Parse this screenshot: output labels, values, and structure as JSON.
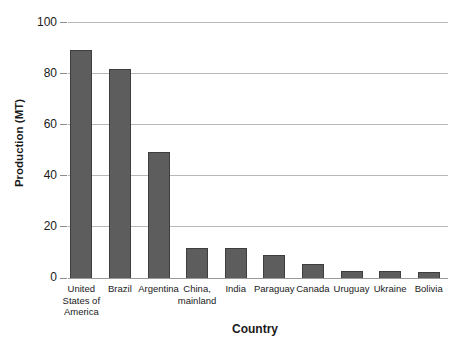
{
  "chart_data": {
    "type": "bar",
    "title": "",
    "xlabel": "Country",
    "ylabel": "Production (MT)",
    "categories": [
      "United\nStates of\nAmerica",
      "Brazil",
      "Argentina",
      "China,\nmainland",
      "India",
      "Paraguay",
      "Canada",
      "Uruguay",
      "Ukraine",
      "Bolivia"
    ],
    "values": [
      89.5,
      82,
      49.3,
      11.8,
      11.6,
      9.1,
      5.4,
      2.9,
      2.6,
      2.2
    ],
    "ylim": [
      0,
      100
    ],
    "yticks": [
      0,
      20,
      40,
      60,
      80,
      100
    ],
    "grid": true,
    "legend": "none",
    "bar_color": "#5d5d5d",
    "bar_border_color": "#3e3e3e",
    "gridline_color": "#b8b8b8",
    "axis_line_color": "#999999",
    "text_color": "#1a1a1a",
    "background_color": "#ffffff"
  }
}
